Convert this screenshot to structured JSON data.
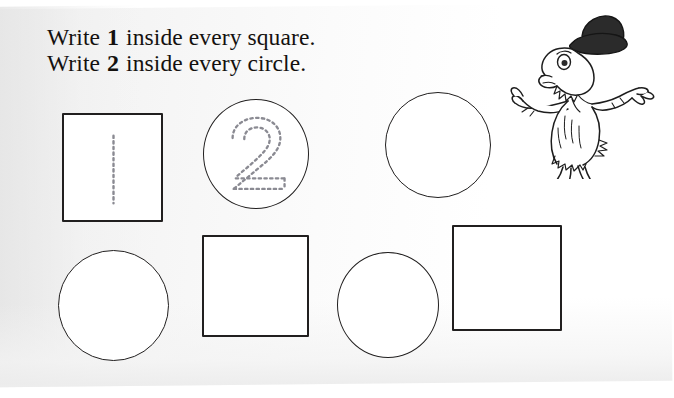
{
  "worksheet": {
    "instructions": [
      {
        "prefix": "Write ",
        "numeral": "1",
        "suffix": " inside every square."
      },
      {
        "prefix": "Write ",
        "numeral": "2",
        "suffix": " inside every circle."
      }
    ],
    "colors": {
      "ink": "#211f1f",
      "text": "#14110f",
      "paper": "#fbfbfb",
      "trace_guide": "#8a8a92"
    },
    "illustration": {
      "name": "dr-seuss-creature-with-bowler-hat",
      "hat_color": "#2b2b2b",
      "fur_color": "#ffffff"
    },
    "shapes": [
      {
        "id": "shape-1",
        "type": "square",
        "row": 1,
        "position": 1,
        "x": 62,
        "y": 113,
        "w": 101,
        "h": 109,
        "trace": "1",
        "filled": false
      },
      {
        "id": "shape-2",
        "type": "circle",
        "row": 1,
        "position": 2,
        "x": 203,
        "y": 99,
        "w": 106,
        "h": 110,
        "trace": "2",
        "filled": false
      },
      {
        "id": "shape-3",
        "type": "circle",
        "row": 1,
        "position": 3,
        "x": 385,
        "y": 92,
        "w": 106,
        "h": 106,
        "trace": null,
        "filled": false
      },
      {
        "id": "shape-4",
        "type": "circle",
        "row": 2,
        "position": 1,
        "x": 58,
        "y": 250,
        "w": 111,
        "h": 111,
        "trace": null,
        "filled": false
      },
      {
        "id": "shape-5",
        "type": "square",
        "row": 2,
        "position": 2,
        "x": 202,
        "y": 235,
        "w": 107,
        "h": 102,
        "trace": null,
        "filled": false
      },
      {
        "id": "shape-6",
        "type": "circle",
        "row": 2,
        "position": 3,
        "x": 337,
        "y": 252,
        "w": 102,
        "h": 106,
        "trace": null,
        "filled": false
      },
      {
        "id": "shape-7",
        "type": "square",
        "row": 2,
        "position": 4,
        "x": 452,
        "y": 225,
        "w": 110,
        "h": 106,
        "trace": null,
        "filled": false
      }
    ]
  }
}
